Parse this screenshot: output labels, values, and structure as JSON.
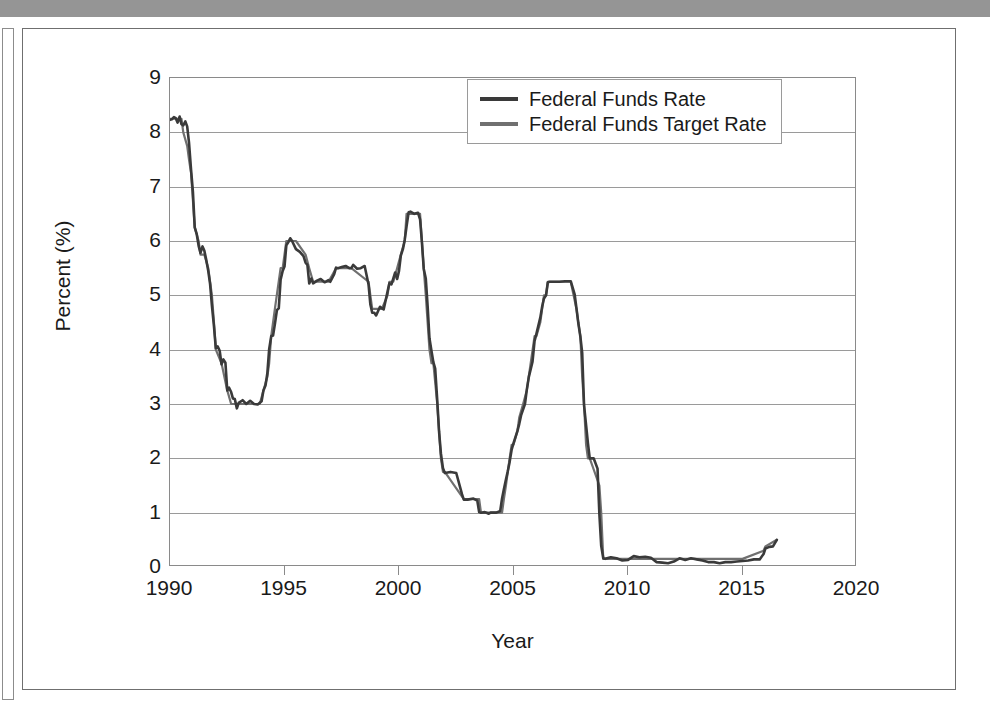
{
  "figure": {
    "background_color": "#ffffff",
    "top_bar_color": "#959595",
    "frame_color": "#6f6f6f"
  },
  "chart_data": {
    "type": "line",
    "title": "",
    "subtitle": "",
    "xlabel": "Year",
    "ylabel": "Percent (%)",
    "xlim": [
      1990,
      2020
    ],
    "ylim": [
      0,
      9
    ],
    "xticks": [
      1990,
      1995,
      2000,
      2005,
      2010,
      2015,
      2020
    ],
    "xtick_labels": [
      "1990",
      "1995",
      "2000",
      "2005",
      "2010",
      "2015",
      "2020"
    ],
    "yticks": [
      0,
      1,
      2,
      3,
      4,
      5,
      6,
      7,
      8,
      9
    ],
    "ytick_labels": [
      "0",
      "1",
      "2",
      "3",
      "4",
      "5",
      "6",
      "7",
      "8",
      "9"
    ],
    "grid": "horizontal",
    "legend_position": "top-right",
    "series": [
      {
        "name": "Federal Funds Rate",
        "color": "#3a3a3a",
        "line_width": 2.6,
        "x": [
          1990.0,
          1990.08,
          1990.17,
          1990.25,
          1990.33,
          1990.42,
          1990.5,
          1990.58,
          1990.67,
          1990.75,
          1990.83,
          1990.92,
          1991.0,
          1991.08,
          1991.17,
          1991.25,
          1991.33,
          1991.42,
          1991.5,
          1991.58,
          1991.67,
          1991.75,
          1991.83,
          1991.92,
          1992.0,
          1992.08,
          1992.17,
          1992.25,
          1992.33,
          1992.42,
          1992.5,
          1992.58,
          1992.67,
          1992.75,
          1992.83,
          1992.92,
          1993.0,
          1993.17,
          1993.33,
          1993.5,
          1993.67,
          1993.83,
          1994.0,
          1994.08,
          1994.17,
          1994.25,
          1994.33,
          1994.42,
          1994.5,
          1994.58,
          1994.67,
          1994.75,
          1994.83,
          1994.92,
          1995.0,
          1995.08,
          1995.17,
          1995.25,
          1995.33,
          1995.5,
          1995.67,
          1995.83,
          1995.92,
          1996.0,
          1996.08,
          1996.17,
          1996.25,
          1996.42,
          1996.58,
          1996.75,
          1996.92,
          1997.0,
          1997.17,
          1997.25,
          1997.33,
          1997.5,
          1997.67,
          1997.83,
          1997.92,
          1998.0,
          1998.17,
          1998.33,
          1998.5,
          1998.67,
          1998.75,
          1998.83,
          1998.92,
          1999.0,
          1999.17,
          1999.33,
          1999.5,
          1999.58,
          1999.67,
          1999.83,
          1999.92,
          2000.0,
          2000.08,
          2000.17,
          2000.25,
          2000.33,
          2000.42,
          2000.5,
          2000.67,
          2000.83,
          2000.92,
          2001.0,
          2001.08,
          2001.17,
          2001.25,
          2001.33,
          2001.42,
          2001.5,
          2001.58,
          2001.67,
          2001.75,
          2001.83,
          2001.92,
          2002.0,
          2002.25,
          2002.5,
          2002.75,
          2002.83,
          2002.92,
          2003.0,
          2003.25,
          2003.42,
          2003.5,
          2003.58,
          2003.75,
          2003.92,
          2004.0,
          2004.25,
          2004.42,
          2004.5,
          2004.58,
          2004.67,
          2004.75,
          2004.83,
          2004.92,
          2005.0,
          2005.17,
          2005.25,
          2005.33,
          2005.5,
          2005.58,
          2005.67,
          2005.83,
          2005.92,
          2006.0,
          2006.17,
          2006.25,
          2006.33,
          2006.42,
          2006.5,
          2006.58,
          2006.75,
          2006.92,
          2007.0,
          2007.25,
          2007.5,
          2007.67,
          2007.75,
          2007.83,
          2007.92,
          2008.0,
          2008.08,
          2008.17,
          2008.25,
          2008.33,
          2008.5,
          2008.67,
          2008.75,
          2008.83,
          2008.92,
          2009.0,
          2009.25,
          2009.5,
          2009.75,
          2010.0,
          2010.25,
          2010.5,
          2010.75,
          2011.0,
          2011.25,
          2011.5,
          2011.75,
          2012.0,
          2012.25,
          2012.5,
          2012.75,
          2013.0,
          2013.25,
          2013.5,
          2013.75,
          2014.0,
          2014.25,
          2014.5,
          2014.75,
          2015.0,
          2015.25,
          2015.5,
          2015.75,
          2015.92,
          2016.0,
          2016.17,
          2016.33,
          2016.5
        ],
        "y": [
          8.23,
          8.24,
          8.28,
          8.26,
          8.18,
          8.29,
          8.15,
          8.13,
          8.2,
          8.11,
          7.81,
          7.31,
          6.91,
          6.25,
          6.12,
          5.91,
          5.78,
          5.9,
          5.82,
          5.66,
          5.45,
          5.21,
          4.81,
          4.43,
          4.03,
          4.06,
          3.98,
          3.73,
          3.82,
          3.76,
          3.25,
          3.3,
          3.22,
          3.1,
          3.09,
          2.92,
          3.02,
          3.07,
          3.0,
          3.06,
          3.0,
          2.99,
          3.05,
          3.25,
          3.34,
          3.56,
          4.01,
          4.25,
          4.26,
          4.47,
          4.73,
          4.76,
          5.29,
          5.45,
          5.53,
          5.92,
          5.98,
          6.05,
          6.0,
          5.85,
          5.8,
          5.72,
          5.6,
          5.56,
          5.22,
          5.31,
          5.22,
          5.27,
          5.3,
          5.24,
          5.28,
          5.25,
          5.39,
          5.51,
          5.5,
          5.52,
          5.54,
          5.5,
          5.5,
          5.56,
          5.49,
          5.5,
          5.54,
          5.2,
          4.83,
          4.68,
          4.68,
          4.63,
          4.79,
          4.74,
          5.07,
          5.22,
          5.2,
          5.42,
          5.3,
          5.45,
          5.73,
          5.85,
          6.02,
          6.27,
          6.53,
          6.54,
          6.5,
          6.52,
          6.4,
          5.98,
          5.49,
          5.31,
          4.8,
          4.21,
          3.97,
          3.77,
          3.65,
          3.07,
          2.49,
          2.09,
          1.82,
          1.73,
          1.75,
          1.73,
          1.34,
          1.24,
          1.24,
          1.24,
          1.26,
          1.22,
          1.01,
          1.0,
          1.01,
          0.98,
          1.0,
          1.0,
          1.03,
          1.26,
          1.43,
          1.61,
          1.76,
          1.93,
          2.16,
          2.28,
          2.5,
          2.63,
          2.79,
          3.0,
          3.26,
          3.5,
          3.78,
          4.16,
          4.29,
          4.59,
          4.79,
          4.94,
          5.0,
          5.24,
          5.25,
          5.25,
          5.25,
          5.25,
          5.26,
          5.26,
          5.02,
          4.76,
          4.49,
          4.24,
          3.94,
          2.98,
          2.61,
          2.28,
          2.0,
          2.0,
          1.81,
          0.97,
          0.39,
          0.16,
          0.15,
          0.18,
          0.16,
          0.12,
          0.13,
          0.2,
          0.18,
          0.19,
          0.17,
          0.09,
          0.08,
          0.07,
          0.1,
          0.16,
          0.13,
          0.16,
          0.14,
          0.12,
          0.09,
          0.09,
          0.07,
          0.09,
          0.09,
          0.1,
          0.11,
          0.12,
          0.14,
          0.14,
          0.24,
          0.34,
          0.37,
          0.38,
          0.5
        ]
      },
      {
        "name": "Federal Funds Target Rate",
        "color": "#707070",
        "line_width": 2.2,
        "x": [
          1990.0,
          1990.5,
          1990.58,
          1990.75,
          1990.83,
          1990.92,
          1991.0,
          1991.08,
          1991.25,
          1991.33,
          1991.5,
          1991.67,
          1991.75,
          1991.83,
          1991.92,
          1992.0,
          1992.25,
          1992.5,
          1992.67,
          1992.83,
          1993.0,
          1993.5,
          1993.92,
          1994.08,
          1994.25,
          1994.33,
          1994.42,
          1994.58,
          1994.83,
          1994.92,
          1995.08,
          1995.17,
          1995.25,
          1995.5,
          1995.92,
          1996.08,
          1996.25,
          1996.92,
          1997.25,
          1997.33,
          1997.92,
          1998.67,
          1998.75,
          1998.83,
          1998.92,
          1999.25,
          1999.5,
          1999.58,
          1999.75,
          1999.92,
          2000.08,
          2000.25,
          2000.33,
          2000.42,
          2000.92,
          2001.0,
          2001.08,
          2001.17,
          2001.25,
          2001.33,
          2001.42,
          2001.5,
          2001.67,
          2001.75,
          2001.83,
          2001.92,
          2002.0,
          2002.83,
          2002.92,
          2003.0,
          2003.5,
          2003.58,
          2003.92,
          2004.0,
          2004.5,
          2004.58,
          2004.67,
          2004.75,
          2004.83,
          2004.92,
          2005.0,
          2005.17,
          2005.25,
          2005.42,
          2005.58,
          2005.75,
          2005.92,
          2006.0,
          2006.17,
          2006.25,
          2006.33,
          2006.42,
          2006.5,
          2006.92,
          2007.0,
          2007.5,
          2007.75,
          2007.83,
          2007.92,
          2008.0,
          2008.08,
          2008.17,
          2008.25,
          2008.33,
          2008.75,
          2008.83,
          2008.92,
          2009.0,
          2010.0,
          2011.0,
          2012.0,
          2013.0,
          2014.0,
          2015.0,
          2015.92,
          2016.0,
          2016.5
        ],
        "y": [
          8.25,
          8.25,
          8.0,
          7.75,
          7.5,
          7.25,
          6.75,
          6.25,
          6.0,
          5.75,
          5.75,
          5.5,
          5.25,
          5.0,
          4.5,
          4.0,
          3.75,
          3.25,
          3.0,
          3.0,
          3.0,
          3.0,
          3.0,
          3.25,
          3.5,
          3.75,
          4.25,
          4.75,
          5.5,
          5.5,
          6.0,
          6.0,
          6.0,
          6.0,
          5.75,
          5.5,
          5.25,
          5.25,
          5.5,
          5.5,
          5.5,
          5.25,
          5.0,
          4.75,
          4.75,
          4.75,
          5.0,
          5.25,
          5.25,
          5.5,
          5.75,
          6.0,
          6.5,
          6.5,
          6.5,
          6.0,
          5.5,
          5.0,
          4.5,
          4.0,
          3.75,
          3.75,
          3.0,
          2.5,
          2.0,
          1.75,
          1.75,
          1.25,
          1.25,
          1.25,
          1.25,
          1.0,
          1.0,
          1.0,
          1.0,
          1.25,
          1.5,
          1.75,
          2.0,
          2.25,
          2.25,
          2.5,
          2.75,
          3.0,
          3.25,
          3.75,
          4.25,
          4.25,
          4.5,
          4.75,
          5.0,
          5.0,
          5.25,
          5.25,
          5.25,
          5.25,
          4.75,
          4.5,
          4.25,
          3.5,
          3.0,
          2.25,
          2.0,
          2.0,
          1.5,
          1.0,
          0.15,
          0.15,
          0.15,
          0.15,
          0.15,
          0.15,
          0.15,
          0.15,
          0.3,
          0.38,
          0.5
        ]
      }
    ],
    "annotations": []
  },
  "axes": {
    "y_title": "Percent (%)",
    "x_title": "Year"
  },
  "legend": {
    "entries": [
      {
        "label": "Federal Funds Rate",
        "color": "#3a3a3a"
      },
      {
        "label": "Federal Funds Target Rate",
        "color": "#707070"
      }
    ]
  }
}
